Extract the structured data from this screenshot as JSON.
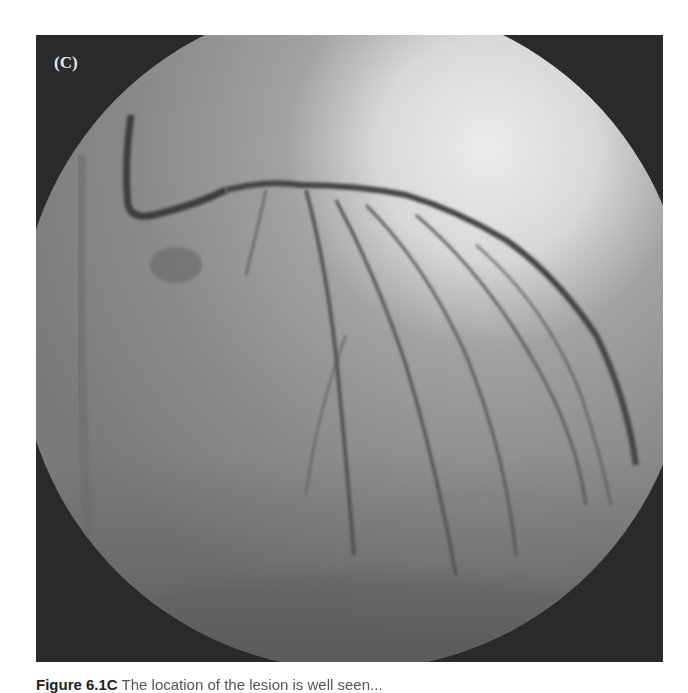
{
  "figure": {
    "panel_label": "(C)",
    "image_description": "Coronary angiogram (fluoroscopy), circular field of view",
    "caption_prefix": "Figure 6.1C",
    "caption_rest": "  The location of the lesion is well seen...",
    "colors": {
      "background": "#ffffff",
      "panel_dark": "#2a2a2a",
      "field_mid": "#8c8c8c",
      "field_bright": "#e6e6e6",
      "vessel": "#4a4a4a"
    }
  }
}
